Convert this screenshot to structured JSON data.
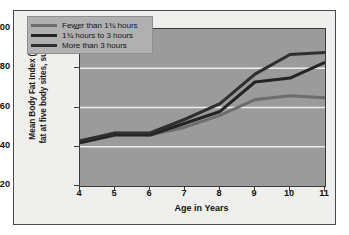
{
  "chart_data": {
    "type": "line",
    "title": "",
    "xlabel": "Age in Years",
    "ylabel": "Mean Body Fat Index (mm of fat at five body sites, summed)",
    "ylabel_line1": "Mean Body Fat Index (mm of",
    "ylabel_line2": "fat at five body sites, summed)",
    "x": [
      4,
      5,
      6,
      7,
      8,
      9,
      10,
      11
    ],
    "categories": [
      "4",
      "5",
      "6",
      "7",
      "8",
      "9",
      "10",
      "11"
    ],
    "xlim": [
      4,
      11
    ],
    "ylim": [
      20,
      100
    ],
    "yticks": [
      20,
      40,
      60,
      80,
      100
    ],
    "yticklabels": [
      "20",
      "40",
      "60",
      "80",
      "100"
    ],
    "grid": "horizontal",
    "legend_position": "top-left",
    "series": [
      {
        "name": "Fewer than 1¾ hours",
        "color": "#6d6d6d",
        "values": [
          42,
          47,
          46,
          50,
          56,
          64,
          66,
          65
        ]
      },
      {
        "name": "1¾ hours to 3 hours",
        "color": "#242424",
        "values": [
          42,
          46,
          46,
          52,
          58,
          73,
          75,
          83
        ]
      },
      {
        "name": "More than 3 hours",
        "color": "#2f2f2f",
        "values": [
          43,
          47,
          47,
          54,
          62,
          77,
          87,
          88
        ]
      }
    ]
  },
  "colors": {
    "figure_background": "#efefed",
    "plot_background": "#9b9b9b",
    "legend_background": "#b0b0b0",
    "gridline": "#eeeeee",
    "axis": "#3a3a3a",
    "text": "#111111"
  }
}
